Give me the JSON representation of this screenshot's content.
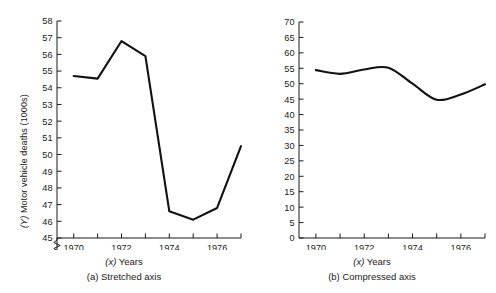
{
  "figure": {
    "shared_ylabel_prefix": "(Y)",
    "shared_ylabel": "(Y) Motor vehicle deaths (1000s)",
    "shared_xlabel": "(x) Years"
  },
  "panel_a": {
    "caption": "(a) Stretched axis",
    "xlabel": "(x) Years",
    "ylabel": "(Y) Motor vehicle deaths (1000s)",
    "ytick_labels": [
      "45",
      "46",
      "47",
      "48",
      "49",
      "50",
      "51",
      "52",
      "53",
      "54",
      "55",
      "56",
      "57",
      "58"
    ],
    "xtick_labels": [
      "1970",
      "1972",
      "1974",
      "1976"
    ],
    "axis_break": "zigzag-below-45"
  },
  "panel_b": {
    "caption": "(b) Compressed axis",
    "xlabel": "(x) Years",
    "ylabel": "(Y) Motor vehicle deaths (1000s)",
    "ytick_labels": [
      "0",
      "5",
      "10",
      "15",
      "20",
      "25",
      "30",
      "35",
      "40",
      "45",
      "50",
      "55",
      "60",
      "65",
      "70"
    ],
    "xtick_labels": [
      "1970",
      "1972",
      "1974",
      "1976"
    ]
  },
  "chart_data": [
    {
      "type": "line",
      "title": "(a) Stretched axis",
      "xlabel": "(x) Years",
      "ylabel": "(Y) Motor vehicle deaths (1000s)",
      "x": [
        1970,
        1971,
        1972,
        1973,
        1974,
        1975,
        1976,
        1977
      ],
      "values": [
        54.7,
        54.55,
        56.8,
        55.9,
        46.6,
        46.1,
        46.8,
        50.5
      ],
      "series": [
        {
          "name": "Motor vehicle deaths (1000s)",
          "values": [
            54.7,
            54.55,
            56.8,
            55.9,
            46.6,
            46.1,
            46.8,
            50.5
          ]
        }
      ],
      "xlim": [
        1969.3,
        1977.0
      ],
      "ylim": [
        45,
        58
      ],
      "ytick_values": [
        45,
        46,
        47,
        48,
        49,
        50,
        51,
        52,
        53,
        54,
        55,
        56,
        57,
        58
      ],
      "xtick_values": [
        1970,
        1971,
        1972,
        1973,
        1974,
        1975,
        1976,
        1977
      ],
      "xtick_labeled": [
        1970,
        1972,
        1974,
        1976
      ],
      "grid": false,
      "legend": "none",
      "axis_break": true,
      "smoothing": "none"
    },
    {
      "type": "line",
      "title": "(b) Compressed axis",
      "xlabel": "(x) Years",
      "ylabel": "(Y) Motor vehicle deaths (1000s)",
      "x": [
        1970,
        1971,
        1972,
        1973,
        1974,
        1975,
        1976,
        1977
      ],
      "values": [
        54.4,
        53.2,
        54.6,
        55.2,
        50.0,
        44.8,
        46.5,
        49.8
      ],
      "series": [
        {
          "name": "Motor vehicle deaths (1000s)",
          "values": [
            54.4,
            53.2,
            54.6,
            55.2,
            50.0,
            44.8,
            46.5,
            49.8
          ]
        }
      ],
      "xlim": [
        1969.3,
        1977.0
      ],
      "ylim": [
        0,
        70
      ],
      "ytick_values": [
        0,
        5,
        10,
        15,
        20,
        25,
        30,
        35,
        40,
        45,
        50,
        55,
        60,
        65,
        70
      ],
      "xtick_values": [
        1970,
        1971,
        1972,
        1973,
        1974,
        1975,
        1976,
        1977
      ],
      "xtick_labeled": [
        1970,
        1972,
        1974,
        1976
      ],
      "grid": false,
      "legend": "none",
      "axis_break": false,
      "smoothing": "spline"
    }
  ]
}
